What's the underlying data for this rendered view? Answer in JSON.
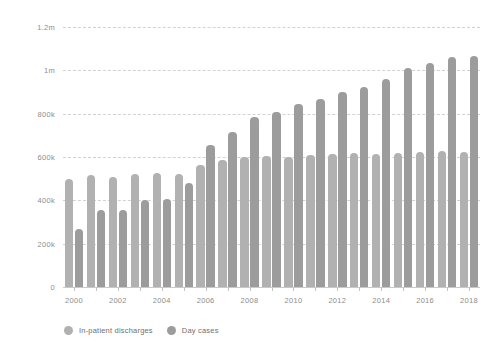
{
  "chart_data": {
    "type": "bar",
    "title": "",
    "subtitle": "",
    "xlabel": "",
    "ylabel": "",
    "grid": true,
    "legend_position": "bottom-left",
    "ylim": [
      0,
      1200000
    ],
    "ytick_values": [
      0,
      200000,
      400000,
      600000,
      800000,
      1000000,
      1200000
    ],
    "ytick_labels": [
      "0",
      "200k",
      "400k",
      "600k",
      "800k",
      "1m",
      "1.2m"
    ],
    "categories": [
      "2000",
      "2001",
      "2002",
      "2003",
      "2004",
      "2005",
      "2006",
      "2007",
      "2008",
      "2009",
      "2010",
      "2011",
      "2012",
      "2013",
      "2014",
      "2015",
      "2016",
      "2017",
      "2018"
    ],
    "xtick_labels_shown": [
      "2000",
      "2002",
      "2004",
      "2006",
      "2008",
      "2010",
      "2012",
      "2014",
      "2016",
      "2018"
    ],
    "series": [
      {
        "name": "In-patient discharges",
        "color": "#b1b1b1",
        "values": [
          500000,
          515000,
          510000,
          520000,
          525000,
          520000,
          565000,
          585000,
          600000,
          605000,
          600000,
          610000,
          615000,
          620000,
          615000,
          620000,
          625000,
          630000,
          625000
        ]
      },
      {
        "name": "Day cases",
        "color": "#9c9c9c",
        "values": [
          270000,
          355000,
          355000,
          400000,
          405000,
          480000,
          655000,
          715000,
          785000,
          810000,
          845000,
          870000,
          900000,
          925000,
          960000,
          1010000,
          1035000,
          1060000,
          1065000
        ]
      }
    ]
  },
  "legend": {
    "items": [
      {
        "label": "In-patient discharges",
        "color": "#b1b1b1"
      },
      {
        "label": "Day cases",
        "color": "#9c9c9c"
      }
    ]
  }
}
